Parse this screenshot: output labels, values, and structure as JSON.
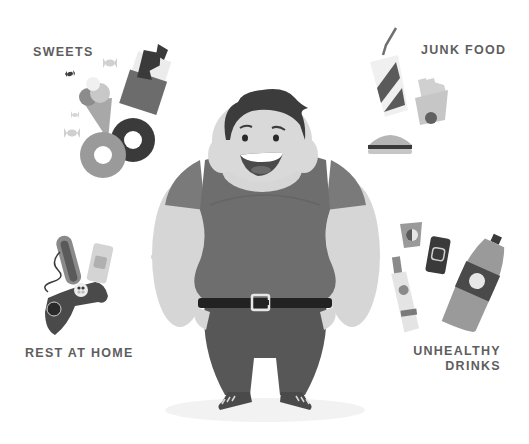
{
  "categories": [
    {
      "id": "sweets",
      "label": "SWEETS",
      "items": [
        "chocolate-bar",
        "ice-cream-cone",
        "donut",
        "candy"
      ]
    },
    {
      "id": "junk_food",
      "label": "JUNK FOOD",
      "items": [
        "soda-cup",
        "french-fries",
        "burger"
      ]
    },
    {
      "id": "rest_at_home",
      "label": "REST AT HOME",
      "items": [
        "hot-dog",
        "soda-can",
        "game-controller"
      ]
    },
    {
      "id": "unhealthy_drinks",
      "label_line1": "UNHEALTHY",
      "label_line2": "DRINKS",
      "items": [
        "paper-cup",
        "soda-can",
        "glass-bottle",
        "plastic-bottle"
      ]
    }
  ],
  "character": {
    "description": "overweight smiling man in t-shirt with belt"
  },
  "colors": {
    "text": "#5e5e5e",
    "shirt": "#6e6e6e",
    "skin": "#d9d9d9",
    "hair": "#3c3c3c",
    "pants": "#555555",
    "belt": "#222222"
  }
}
